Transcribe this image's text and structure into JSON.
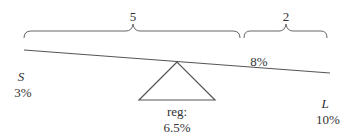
{
  "diagram": {
    "type": "seesaw-balance",
    "braces": {
      "left": {
        "label": "5"
      },
      "right": {
        "label": "2"
      }
    },
    "beam": {
      "left_end": {
        "name": "S",
        "value": "3%"
      },
      "right_end": {
        "name": "L",
        "value": "10%"
      },
      "marker": {
        "value": "8%"
      }
    },
    "fulcrum": {
      "label": "reg:",
      "value": "6.5%"
    },
    "colors": {
      "line": "#555555",
      "text": "#333333"
    }
  }
}
